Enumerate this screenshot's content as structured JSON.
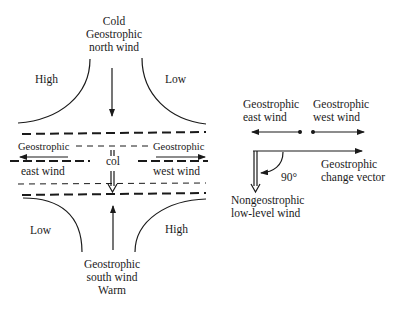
{
  "left_diagram": {
    "top_label": [
      "Cold",
      "Geostrophic",
      "north wind"
    ],
    "bottom_label": [
      "Geostrophic",
      "south wind",
      "Warm"
    ],
    "quadrants": {
      "top_left": "High",
      "top_right": "Low",
      "bottom_left": "Low",
      "bottom_right": "High"
    },
    "col_label": "col",
    "left_wind": [
      "Geostrophic",
      "east wind"
    ],
    "right_wind": [
      "Geostrophic",
      "west wind"
    ]
  },
  "right_diagram": {
    "east_wind": [
      "Geostrophic",
      "east wind"
    ],
    "west_wind": [
      "Geostrophic",
      "west wind"
    ],
    "change_vector": [
      "Geostrophic",
      "change vector"
    ],
    "angle": "90°",
    "low_level_wind": [
      "Nongeostrophic",
      "low-level wind"
    ]
  },
  "colors": {
    "ink": "#1a1a1a",
    "background": "#ffffff"
  }
}
